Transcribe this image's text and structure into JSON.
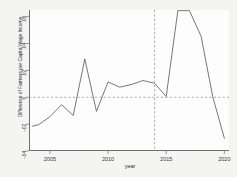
{
  "chart_data": {
    "type": "line",
    "title": "",
    "xlabel": "year",
    "ylabel": "Difference of Farmers per Capita Wage Income",
    "xlim": [
      2003.2,
      2020.4
    ],
    "ylim": [
      -0.04,
      0.065
    ],
    "xticks": [
      2005,
      2010,
      2015,
      2020
    ],
    "xticklabels": [
      "2005",
      "2010",
      "2015",
      "2020"
    ],
    "yticks": [
      -0.04,
      -0.02,
      0,
      0.02,
      0.04,
      0.06
    ],
    "yticklabels": [
      "-.04",
      "-.02",
      "0",
      ".02",
      ".04",
      ".06"
    ],
    "grid": false,
    "legend": null,
    "series": [
      {
        "name": "Difference of Farmers per Capita Wage Income",
        "color": "#555555",
        "x": [
          2003.5,
          2004,
          2005,
          2006,
          2007,
          2008,
          2009,
          2010,
          2011,
          2012,
          2013,
          2014,
          2015,
          2016,
          2017,
          2018,
          2019,
          2020
        ],
        "values": [
          -0.0215,
          -0.0205,
          -0.0145,
          -0.0055,
          -0.0135,
          0.0285,
          -0.0105,
          0.0115,
          0.0075,
          0.0095,
          0.0125,
          0.0105,
          0.0005,
          0.0645,
          0.0645,
          0.0455,
          0.0005,
          -0.0305
        ]
      }
    ],
    "reference_lines": [
      {
        "name": "zero-line",
        "orientation": "horizontal",
        "value": 0,
        "style": "dashed",
        "color": "#8a8a8a"
      },
      {
        "name": "treatment-year-line",
        "orientation": "vertical",
        "value": 2014,
        "style": "dashed",
        "color": "#8a8a8a"
      }
    ]
  }
}
